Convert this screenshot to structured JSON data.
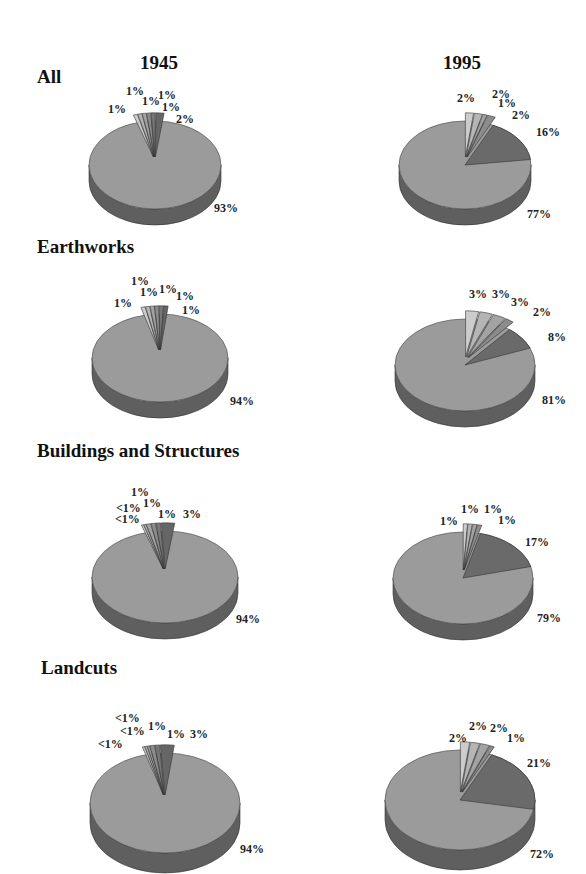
{
  "columns": [
    "1945",
    "1995"
  ],
  "sections": [
    {
      "title": "All"
    },
    {
      "title": "Earthworks"
    },
    {
      "title": "Buildings and Structures"
    },
    {
      "title": "Landcuts"
    }
  ],
  "colors": {
    "main": "#9b9b9b",
    "main_side": "#5f5f5f",
    "dark": "#6a6a6a",
    "dark_side": "#444444",
    "slice_light": "#cfcfcf"
  },
  "chart_data": [
    {
      "type": "pie",
      "title": "All 1945",
      "labels": [
        "93%",
        "1%",
        "1%",
        "1%",
        "1%",
        "1%",
        "2%"
      ],
      "values": [
        93,
        1,
        1,
        1,
        1,
        1,
        2
      ]
    },
    {
      "type": "pie",
      "title": "All 1995",
      "labels": [
        "77%",
        "2%",
        "2%",
        "1%",
        "2%",
        "16%"
      ],
      "values": [
        77,
        2,
        2,
        1,
        2,
        16
      ]
    },
    {
      "type": "pie",
      "title": "Earthworks 1945",
      "labels": [
        "94%",
        "1%",
        "1%",
        "1%",
        "1%",
        "1%",
        "1%"
      ],
      "values": [
        94,
        1,
        1,
        1,
        1,
        1,
        1
      ]
    },
    {
      "type": "pie",
      "title": "Earthworks 1995",
      "labels": [
        "81%",
        "3%",
        "3%",
        "3%",
        "2%",
        "8%"
      ],
      "values": [
        81,
        3,
        3,
        3,
        2,
        8
      ]
    },
    {
      "type": "pie",
      "title": "Buildings and Structures 1945",
      "labels": [
        "94%",
        "<1%",
        "<1%",
        "1%",
        "1%",
        "1%",
        "3%"
      ],
      "values": [
        94,
        0.5,
        0.5,
        1,
        1,
        1,
        3
      ]
    },
    {
      "type": "pie",
      "title": "Buildings and Structures 1995",
      "labels": [
        "79%",
        "1%",
        "1%",
        "1%",
        "1%",
        "17%"
      ],
      "values": [
        79,
        1,
        1,
        1,
        1,
        17
      ]
    },
    {
      "type": "pie",
      "title": "Landcuts 1945",
      "labels": [
        "94%",
        "<1%",
        "<1%",
        "<1%",
        "1%",
        "1%",
        "3%"
      ],
      "values": [
        94,
        0.5,
        0.5,
        0.5,
        1,
        1,
        3
      ]
    },
    {
      "type": "pie",
      "title": "Landcuts 1995",
      "labels": [
        "72%",
        "2%",
        "2%",
        "2%",
        "1%",
        "21%"
      ],
      "values": [
        72,
        2,
        2,
        2,
        1,
        21
      ]
    }
  ]
}
